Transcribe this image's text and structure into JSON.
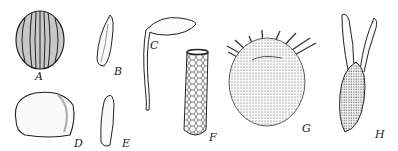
{
  "figure": {
    "labels": {
      "a": "A",
      "b": "B",
      "c": "C",
      "d": "D",
      "e": "E",
      "f": "F",
      "g": "G",
      "h": "H"
    },
    "ink_color": "#222222",
    "background": "#ffffff"
  }
}
